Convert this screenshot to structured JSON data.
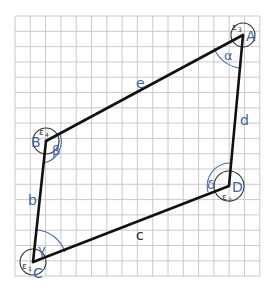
{
  "diagram": {
    "grid": {
      "columns": 16,
      "rows": 17
    },
    "vertices": [
      {
        "id": "A",
        "label": "A",
        "interior_angle": "α",
        "exterior_angle": "ε",
        "exterior_index": "3"
      },
      {
        "id": "B",
        "label": "B",
        "interior_angle": "β",
        "exterior_angle": "ε",
        "exterior_index": "4"
      },
      {
        "id": "C",
        "label": "C",
        "interior_angle": "γ",
        "exterior_angle": "ε",
        "exterior_index": "1"
      },
      {
        "id": "D",
        "label": "D",
        "interior_angle": "δ",
        "exterior_angle": "ε",
        "exterior_index": "2"
      }
    ],
    "sides": [
      {
        "id": "e",
        "label": "e",
        "from": "B",
        "to": "A"
      },
      {
        "id": "d",
        "label": "d",
        "from": "A",
        "to": "D"
      },
      {
        "id": "c",
        "label": "c",
        "from": "D",
        "to": "C"
      },
      {
        "id": "b",
        "label": "b",
        "from": "C",
        "to": "B"
      }
    ],
    "colors": {
      "lines": "#111111",
      "labels": "#3f63a3",
      "grid": "#c4c4c4",
      "exterior_circles": "#333333"
    }
  }
}
